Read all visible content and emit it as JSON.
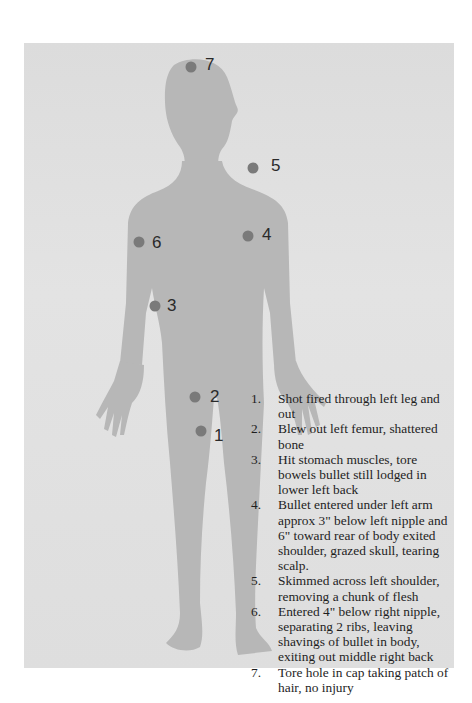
{
  "diagram": {
    "colors": {
      "panel_background": "#dedede",
      "silhouette": "#b5b5b5",
      "marker_dot": "#7a7a7a",
      "text": "#1e1e1e"
    },
    "markers": [
      {
        "id": 1,
        "label": "1",
        "location": "left leg (lower thigh)"
      },
      {
        "id": 2,
        "label": "2",
        "location": "left femur (upper thigh)"
      },
      {
        "id": 3,
        "label": "3",
        "location": "stomach / right hip"
      },
      {
        "id": 4,
        "label": "4",
        "location": "under left arm"
      },
      {
        "id": 5,
        "label": "5",
        "location": "left shoulder"
      },
      {
        "id": 6,
        "label": "6",
        "location": "below right nipple"
      },
      {
        "id": 7,
        "label": "7",
        "location": "top of head"
      }
    ],
    "legend": [
      {
        "num": "1.",
        "text": "Shot fired through left leg and out"
      },
      {
        "num": "2.",
        "text": "Blew out left femur, shattered bone"
      },
      {
        "num": "3.",
        "text": "Hit stomach muscles, tore bowels bullet still lodged in lower left back"
      },
      {
        "num": "4.",
        "text": "Bullet entered under left arm approx 3\" below left nipple and 6\" toward rear of body exited shoulder, grazed skull, tearing scalp."
      },
      {
        "num": "5.",
        "text": "Skimmed across left shoulder, removing a chunk of flesh"
      },
      {
        "num": "6.",
        "text": "Entered 4\" below right nipple, separating 2 ribs, leaving shavings of bullet in body, exiting out middle right back"
      },
      {
        "num": "7.",
        "text": "Tore hole in cap taking patch of hair, no injury"
      }
    ]
  }
}
